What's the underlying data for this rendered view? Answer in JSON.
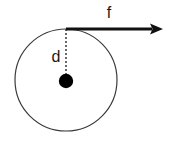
{
  "figure": {
    "type": "physics-force-diagram",
    "background_color": "#ffffff",
    "stroke_color": "#3a3a3a",
    "ink_color": "#000000",
    "labels": {
      "force_label": "f",
      "distance_label": "d"
    },
    "geometry": {
      "circle": {
        "center_x": 66,
        "center_y": 80,
        "radius": 51,
        "stroke_width": 1.2
      },
      "center_dot": {
        "cx": 66,
        "cy": 81,
        "r": 7
      },
      "dashed_radius": {
        "x": 66,
        "y_top": 29,
        "y_bottom": 81,
        "dash_pattern": "2,2"
      },
      "force_arrow": {
        "x_start": 66,
        "x_end": 163,
        "y": 29,
        "stroke_width": 2.6,
        "head_length": 12,
        "head_half_width": 6
      },
      "force_label_pos": {
        "x": 109,
        "y": 18
      },
      "distance_label_pos": {
        "x": 56,
        "y": 62
      }
    }
  }
}
